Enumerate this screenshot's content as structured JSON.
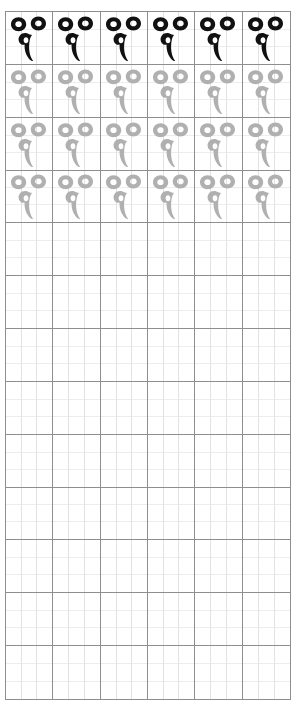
{
  "worksheet": {
    "type": "handwriting-practice-grid",
    "title": "Handwriting Practice Grid",
    "page_width": 306,
    "page_height": 708,
    "grid": {
      "columns": 6,
      "rows": 13,
      "subdivisions_per_cell": 3,
      "origin_x": 5,
      "origin_y": 11,
      "width": 286,
      "height": 689,
      "cell_width": 47.67,
      "cell_height": 53.0,
      "border_color": "#8e8e8e",
      "subgrid_color_vertical": "#e2e2e2",
      "subgrid_color_horizontal": "#ededed",
      "background_color": "#ffffff"
    },
    "glyph": {
      "name": "thai-character-ringed-hook",
      "description": "two small rings above a curved hooked stroke",
      "ink_color": "#111111",
      "trace_color": "#b0b0b0",
      "width": 40,
      "height": 46
    },
    "rows": [
      {
        "index": 1,
        "style": "ink",
        "color": "#111111",
        "filled": true
      },
      {
        "index": 2,
        "style": "trace",
        "color": "#b0b0b0",
        "filled": true
      },
      {
        "index": 3,
        "style": "trace",
        "color": "#b0b0b0",
        "filled": true
      },
      {
        "index": 4,
        "style": "trace",
        "color": "#b0b0b0",
        "filled": true
      },
      {
        "index": 5,
        "style": "blank",
        "color": null,
        "filled": false
      },
      {
        "index": 6,
        "style": "blank",
        "color": null,
        "filled": false
      },
      {
        "index": 7,
        "style": "blank",
        "color": null,
        "filled": false
      },
      {
        "index": 8,
        "style": "blank",
        "color": null,
        "filled": false
      },
      {
        "index": 9,
        "style": "blank",
        "color": null,
        "filled": false
      },
      {
        "index": 10,
        "style": "blank",
        "color": null,
        "filled": false
      },
      {
        "index": 11,
        "style": "blank",
        "color": null,
        "filled": false
      },
      {
        "index": 12,
        "style": "blank",
        "color": null,
        "filled": false
      },
      {
        "index": 13,
        "style": "blank",
        "color": null,
        "filled": false
      }
    ]
  }
}
